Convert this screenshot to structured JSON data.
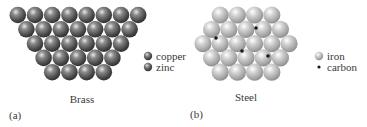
{
  "panels": [
    {
      "id": "a",
      "letter": "(a)",
      "caption": "Brass",
      "rows": [
        8,
        7,
        6,
        5,
        4
      ],
      "legend": [
        {
          "label": "copper",
          "kind": "sphere-dark"
        },
        {
          "label": "zinc",
          "kind": "sphere-dark"
        }
      ]
    },
    {
      "id": "b",
      "letter": "(b)",
      "caption": "Steel",
      "rows": [
        4,
        5,
        6,
        5,
        4
      ],
      "carbon_sites": [
        [
          1,
          0.5
        ],
        [
          1,
          2.5
        ],
        [
          2,
          2.5
        ],
        [
          3,
          2.5
        ]
      ],
      "legend": [
        {
          "label": "iron",
          "kind": "sphere-light"
        },
        {
          "label": "carbon",
          "kind": "dot"
        }
      ]
    }
  ],
  "colors": {
    "brass_sphere": "#6e6e6e",
    "iron_sphere": "#bdbdbd",
    "carbon": "#1a1a1a",
    "text": "#3a3a3a"
  }
}
